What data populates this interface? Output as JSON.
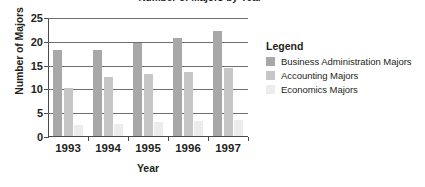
{
  "chart_data": {
    "type": "bar",
    "title": "Number of Majors by Year",
    "xlabel": "Year",
    "ylabel": "Number of Majors",
    "categories": [
      "1993",
      "1994",
      "1995",
      "1996",
      "1997"
    ],
    "series": [
      {
        "name": "Business Administration Majors",
        "color": "#a8a8a8",
        "values": [
          18,
          18,
          19.5,
          20.5,
          22
        ]
      },
      {
        "name": "Accounting Majors",
        "color": "#c6c6c6",
        "values": [
          10,
          12.5,
          13,
          13.5,
          14.3
        ]
      },
      {
        "name": "Economics Majors",
        "color": "#ececec",
        "values": [
          2.3,
          2.6,
          2.9,
          3.1,
          3.3
        ]
      }
    ],
    "ylim": [
      0,
      25
    ],
    "yticks": [
      0,
      5,
      10,
      15,
      20,
      25
    ],
    "grid": true,
    "legend": {
      "title": "Legend",
      "position": "right",
      "entries": [
        "Business Administration Majors",
        "Accounting Majors",
        "Economics Majors"
      ]
    }
  }
}
